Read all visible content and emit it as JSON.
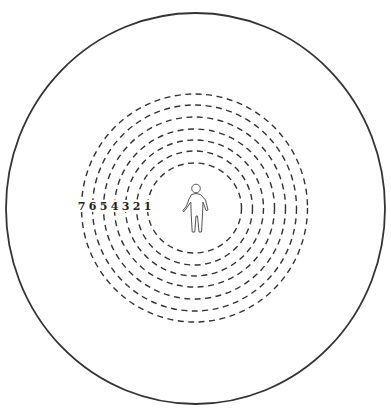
{
  "diagram": {
    "type": "concentric-zones",
    "outer_boundary": {
      "cx": 195.5,
      "cy": 208.5,
      "rx": 189.5,
      "ry": 195.5,
      "stroke": "#333333"
    },
    "center": {
      "x": 194.5,
      "y": 208
    },
    "rings": [
      {
        "label": "1",
        "rx": 47,
        "ry": 45
      },
      {
        "label": "2",
        "rx": 58,
        "ry": 57
      },
      {
        "label": "3",
        "rx": 69,
        "ry": 68
      },
      {
        "label": "4",
        "rx": 80,
        "ry": 79
      },
      {
        "label": "5",
        "rx": 91,
        "ry": 91
      },
      {
        "label": "6",
        "rx": 102,
        "ry": 103
      },
      {
        "label": "7",
        "rx": 113,
        "ry": 114
      }
    ],
    "ring_style": {
      "stroke": "#333333",
      "dash": "6 4.5",
      "width": 1.4
    },
    "figure": {
      "icon": "person-outline-icon",
      "stroke": "#555555"
    }
  }
}
